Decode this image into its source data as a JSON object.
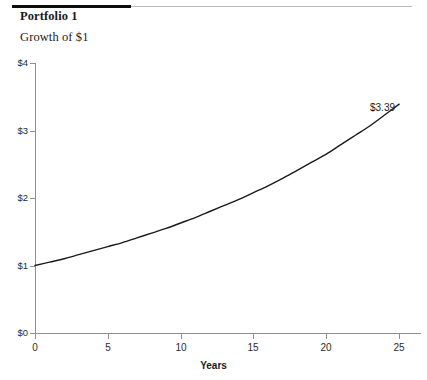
{
  "header": {
    "title": "Portfolio 1",
    "subtitle": "Growth of $1",
    "rule_color_primary": "#0c0c0c",
    "rule_color_secondary": "#b9b9b9"
  },
  "chart_data": {
    "type": "line",
    "title": "Growth of $1",
    "xlabel": "Years",
    "ylabel": "",
    "xlim": [
      0,
      26.5
    ],
    "ylim": [
      0,
      4
    ],
    "grid": false,
    "legend": null,
    "x_ticks": [
      0,
      5,
      10,
      15,
      20,
      25
    ],
    "x_tick_labels": [
      "0",
      "5",
      "10",
      "15",
      "20",
      "25"
    ],
    "y_ticks": [
      0,
      1,
      2,
      3,
      4
    ],
    "y_tick_labels": [
      "$0",
      "$1",
      "$2",
      "$3",
      "$4"
    ],
    "line_color": "#1a1a1a",
    "line_width": 1.4,
    "annotations": [
      {
        "text": "$3.39",
        "x": 25,
        "y": 3.39
      }
    ],
    "series": [
      {
        "name": "Growth of $1",
        "x": [
          0,
          1,
          2,
          3,
          4,
          5,
          6,
          7,
          8,
          9,
          10,
          11,
          12,
          13,
          14,
          15,
          16,
          17,
          18,
          19,
          20,
          21,
          22,
          23,
          24,
          25
        ],
        "values": [
          1.0,
          1.05,
          1.1,
          1.16,
          1.22,
          1.28,
          1.34,
          1.41,
          1.48,
          1.55,
          1.63,
          1.71,
          1.8,
          1.89,
          1.98,
          2.08,
          2.18,
          2.29,
          2.41,
          2.53,
          2.65,
          2.79,
          2.93,
          3.07,
          3.23,
          3.39
        ]
      }
    ]
  }
}
